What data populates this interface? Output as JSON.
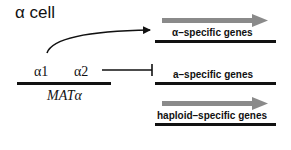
{
  "diagram": {
    "title": "α cell",
    "locus": {
      "label": "MATα",
      "genes": [
        "α1",
        "α2"
      ]
    },
    "targets": [
      {
        "label": "α–specific genes",
        "state": "activated",
        "regulator": "α1"
      },
      {
        "label": "a–specific genes",
        "state": "repressed",
        "regulator": "α2"
      },
      {
        "label": "haploid–specific genes",
        "state": "expressed",
        "regulator": null
      }
    ],
    "colors": {
      "line": "#111111",
      "transcript_arrow": "#8a8a8a"
    }
  }
}
